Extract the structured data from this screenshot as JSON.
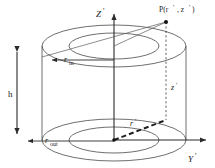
{
  "figure": {
    "background_color": "#ffffff",
    "line_color": "#404040",
    "axis_color": "#2b2b2b",
    "text_color": "#1a1a1a"
  },
  "axes": [
    {
      "name": "vertical-axis",
      "label": "Z",
      "prime": "'",
      "direction": "up"
    },
    {
      "name": "horizontal-axis",
      "label": "Y",
      "prime": "'",
      "direction": "right"
    }
  ],
  "point": {
    "name": "point-P",
    "label": "P(r",
    "label_prime1": "'",
    "label_mid": ", z",
    "label_prime2": "'",
    "label_end": ")",
    "full_label": "P(r', z')",
    "marker": "filled-dot"
  },
  "dimensions": [
    {
      "name": "height",
      "label": "h",
      "subscript": "",
      "prime": "",
      "style": "double-arrow-vertical"
    },
    {
      "name": "inner-radius",
      "label": "r",
      "subscript": "in",
      "prime": "",
      "style": "single-arrow-left"
    },
    {
      "name": "outer-radius",
      "label": "r",
      "subscript": "out",
      "prime": "",
      "style": "single-arrow-left"
    }
  ],
  "coordinates": [
    {
      "name": "radial-coordinate",
      "label": "r",
      "prime": "'",
      "style": "bold-dashed"
    },
    {
      "name": "vertical-coordinate",
      "label": "z",
      "prime": "'",
      "style": "dashed"
    }
  ],
  "shapes": {
    "top_annulus": {
      "outer_rx": 72,
      "outer_ry": 21,
      "inner_rx": 45,
      "inner_ry": 13,
      "cy": 46
    },
    "bottom_annulus": {
      "outer_rx": 72,
      "outer_ry": 21,
      "inner_rx": 45,
      "inner_ry": 13,
      "cy": 140
    },
    "center_x": 114
  }
}
